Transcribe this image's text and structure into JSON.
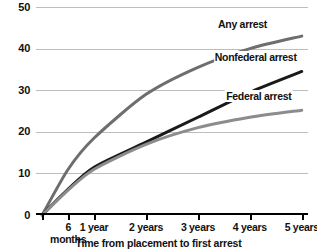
{
  "chart_data": {
    "type": "line",
    "title": "",
    "xlabel": "Time from placement to first arrest",
    "ylabel": "",
    "ylim": [
      0,
      50
    ],
    "yticks": [
      0,
      10,
      20,
      30,
      40,
      50
    ],
    "grid": true,
    "legend_position": "inline-right",
    "x": [
      0,
      0.5,
      1,
      2,
      3,
      4,
      5
    ],
    "categories": [
      "0",
      "6 months",
      "1 year",
      "2 years",
      "3 years",
      "4 years",
      "5 years"
    ],
    "xtick_labels": [
      {
        "line1": "6",
        "line2": "months",
        "x": 0.5
      },
      {
        "line1": "1 year",
        "line2": "",
        "x": 1
      },
      {
        "line1": "2 years",
        "line2": "",
        "x": 2
      },
      {
        "line1": "3 years",
        "line2": "",
        "x": 3
      },
      {
        "line1": "4 years",
        "line2": "",
        "x": 4
      },
      {
        "line1": "5 years",
        "line2": "",
        "x": 5
      }
    ],
    "series": [
      {
        "name": "Any arrest",
        "color": "#6e6e6e",
        "width": 3.0,
        "values": [
          0,
          11.0,
          18.5,
          29.0,
          35.5,
          40.0,
          43.0
        ],
        "label_x": 4.35,
        "label_y": 46.0
      },
      {
        "name": "Nonfederal arrest",
        "color": "#1a1a1a",
        "width": 3.0,
        "values": [
          0,
          6.2,
          11.5,
          17.5,
          23.5,
          29.5,
          34.5
        ],
        "label_x": 4.92,
        "label_y": 38.0
      },
      {
        "name": "Federal arrest",
        "color": "#8c8c8c",
        "width": 3.0,
        "values": [
          0,
          6.0,
          11.0,
          17.0,
          21.0,
          23.5,
          25.2
        ],
        "label_x": 4.82,
        "label_y": 28.5
      }
    ]
  },
  "ytick_labels": [
    "0",
    "10",
    "20",
    "30",
    "40",
    "50"
  ],
  "axis": {
    "title": "Time from placement to first arrest"
  },
  "colors": {
    "any_arrest": "#6e6e6e",
    "nonfederal_arrest": "#1a1a1a",
    "federal_arrest": "#8c8c8c",
    "gridline": "#bdbdbd",
    "axis": "#000000",
    "background": "#ffffff"
  }
}
